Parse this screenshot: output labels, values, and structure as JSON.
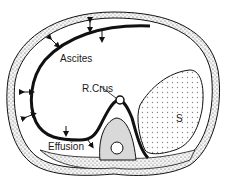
{
  "diagram": {
    "type": "anatomical cross-section",
    "labels": {
      "ascites": "Ascites",
      "crus": "R.Crus",
      "effusion": "Effusion",
      "spleen": "S"
    },
    "colors": {
      "outline": "#111111",
      "wall_fill": "#f2f2f2",
      "vertebra_fill": "#d9d9d9",
      "spleen_dots": "#888888",
      "background": "#ffffff"
    }
  }
}
